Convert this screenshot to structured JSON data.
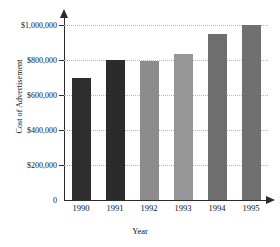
{
  "chart_data": {
    "type": "bar",
    "title": "",
    "xlabel": "Year",
    "ylabel": "Cost of Advertisement",
    "categories": [
      "1990",
      "1991",
      "1992",
      "1993",
      "1994",
      "1995"
    ],
    "values": [
      700000,
      800000,
      795000,
      835000,
      950000,
      1000000
    ],
    "bar_colors": [
      "#2e2e2e",
      "#2b2b2b",
      "#8c8c8c",
      "#969696",
      "#6e6e6e",
      "#707070"
    ],
    "ylim": [
      0,
      1000000
    ],
    "ytick_values": [
      0,
      200000,
      400000,
      600000,
      800000,
      1000000
    ],
    "ytick_labels": [
      "0",
      "$200,000",
      "$400,000",
      "$600,000",
      "$800,000",
      "$1,000,000"
    ],
    "grid": true,
    "grid_style": "dotted",
    "grid_color": "#b9b9b9",
    "legend": "none",
    "axis_color": "#2b2b2b",
    "background": "#ffffff"
  }
}
